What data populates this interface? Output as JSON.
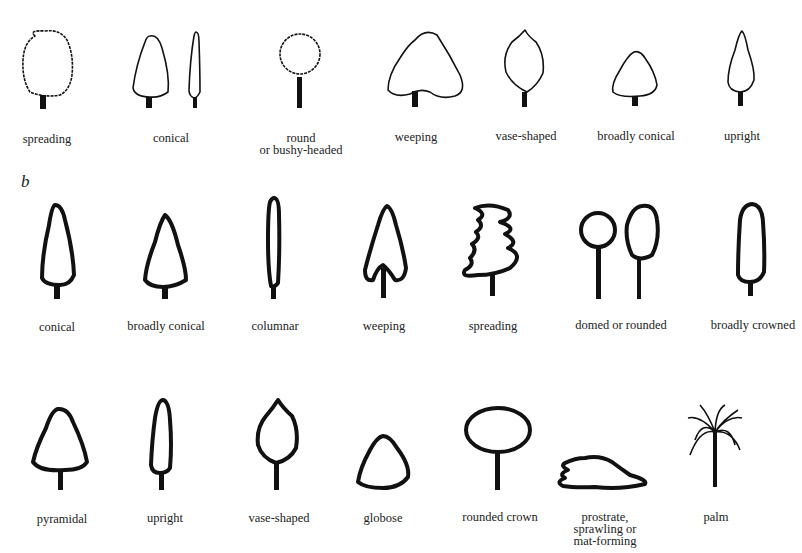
{
  "section_b_label": "b",
  "row_a": {
    "labels": [
      "spreading",
      "conical",
      "round",
      "or bushy-headed",
      "weeping",
      "vase-shaped",
      "broadly conical",
      "upright"
    ]
  },
  "row_b": {
    "labels": [
      "conical",
      "broadly conical",
      "columnar",
      "weeping",
      "spreading",
      "domed or rounded",
      "broadly crowned"
    ]
  },
  "row_c": {
    "labels": [
      "pyramidal",
      "upright",
      "vase-shaped",
      "globose",
      "rounded crown",
      "prostrate,",
      "sprawling or",
      "mat-forming",
      "palm"
    ]
  }
}
